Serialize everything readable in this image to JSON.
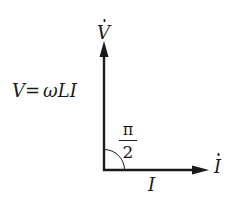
{
  "diagram": {
    "type": "phasor-diagram",
    "labels": {
      "voltage_phasor": "V",
      "current_phasor": "I",
      "equation_lhs": "V",
      "equation_eq": "=",
      "equation_rhs": "ωLI",
      "angle_numerator": "π",
      "angle_denominator": "2",
      "current_magnitude": "I"
    },
    "vectors": [
      {
        "name": "voltage",
        "direction": "up",
        "label": "V̇"
      },
      {
        "name": "current",
        "direction": "right",
        "label": "İ"
      }
    ],
    "angle": "π/2",
    "colors": {
      "stroke": "#1a1a1a",
      "background": "#ffffff"
    }
  }
}
